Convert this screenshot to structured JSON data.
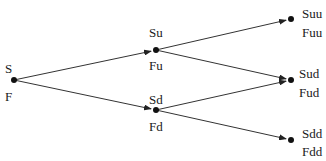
{
  "diagram": {
    "type": "binomial-tree",
    "nodes": [
      {
        "id": "root",
        "price_label": "S",
        "value_label": "F",
        "x": 14,
        "y": 80
      },
      {
        "id": "u",
        "price_label": "Su",
        "value_label": "Fu",
        "x": 156,
        "y": 50
      },
      {
        "id": "d",
        "price_label": "Sd",
        "value_label": "Fd",
        "x": 156,
        "y": 110
      },
      {
        "id": "uu",
        "price_label": "Suu",
        "value_label": "Fuu",
        "x": 291,
        "y": 19
      },
      {
        "id": "ud",
        "price_label": "Sud",
        "value_label": "Fud",
        "x": 291,
        "y": 80
      },
      {
        "id": "dd",
        "price_label": "Sdd",
        "value_label": "Fdd",
        "x": 291,
        "y": 140
      }
    ],
    "edges": [
      {
        "from": "root",
        "to": "u"
      },
      {
        "from": "root",
        "to": "d"
      },
      {
        "from": "u",
        "to": "uu"
      },
      {
        "from": "u",
        "to": "ud"
      },
      {
        "from": "d",
        "to": "ud"
      },
      {
        "from": "d",
        "to": "dd"
      }
    ],
    "colors": {
      "line": "#333333",
      "node": "#111111"
    }
  }
}
